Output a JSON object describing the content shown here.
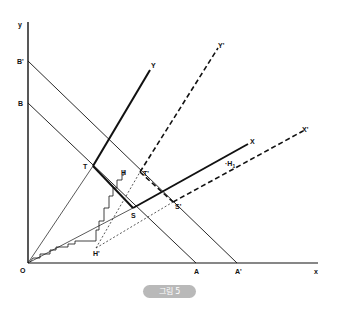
{
  "figure": {
    "caption": "그림 5",
    "axes": {
      "y_label": "y",
      "x_label": "x",
      "origin_label": "O"
    },
    "intercepts": {
      "B_prime": "B'",
      "B": "B",
      "A": "A",
      "A_prime": "A'"
    },
    "rays": {
      "Y": "Y",
      "Y_prime": "Y'",
      "X": "X",
      "X_prime": "X'"
    },
    "points": {
      "T": "T",
      "T_prime": "T'",
      "S": "S",
      "S_prime": "S'",
      "H": "H",
      "H_prime": "H'",
      "H1": "H",
      "H1_sub": "1"
    },
    "colors": {
      "line": "#111111",
      "caption_bg": "#b9b9b9",
      "caption_text": "#ffffff"
    }
  }
}
